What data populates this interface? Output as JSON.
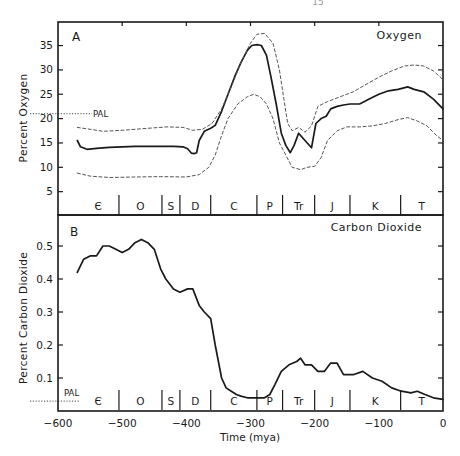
{
  "page": {
    "number_fragment": "15"
  },
  "chart_data": [
    {
      "panel": "A",
      "type": "line",
      "title": "Oxygen",
      "xlabel": "Time (mya)",
      "ylabel": "Percent Oxygen",
      "xlim": [
        -600,
        0
      ],
      "ylim": [
        0,
        39
      ],
      "yticks": [
        5,
        10,
        15,
        20,
        25,
        30,
        35
      ],
      "reference_line": {
        "label": "PAL",
        "value": 21
      },
      "series": [
        {
          "name": "Oxygen (best estimate)",
          "style": "solid",
          "x": [
            -570,
            -565,
            -555,
            -540,
            -520,
            -500,
            -480,
            -460,
            -440,
            -420,
            -405,
            -398,
            -392,
            -388,
            -384,
            -380,
            -372,
            -362,
            -355,
            -345,
            -335,
            -325,
            -315,
            -305,
            -298,
            -290,
            -283,
            -275,
            -268,
            -260,
            -252,
            -245,
            -238,
            -232,
            -225,
            -215,
            -205,
            -198,
            -190,
            -182,
            -175,
            -165,
            -155,
            -145,
            -130,
            -115,
            -100,
            -85,
            -70,
            -55,
            -45,
            -30,
            -15,
            0
          ],
          "values": [
            15.5,
            14.2,
            13.7,
            13.9,
            14.1,
            14.2,
            14.3,
            14.3,
            14.3,
            14.3,
            14.2,
            13.8,
            12.9,
            12.8,
            13.0,
            15.5,
            17.4,
            18.0,
            18.6,
            21.5,
            25.0,
            28.5,
            31.5,
            34.0,
            35.0,
            35.2,
            35.0,
            33.0,
            28.5,
            23.0,
            17.0,
            14.5,
            13.0,
            14.5,
            17.0,
            15.5,
            14.0,
            19.0,
            20.0,
            20.5,
            22.0,
            22.5,
            22.8,
            23.0,
            23.0,
            24.0,
            25.0,
            25.7,
            26.0,
            26.5,
            26.0,
            25.5,
            24.0,
            22.0
          ]
        },
        {
          "name": "Oxygen upper bound",
          "style": "dashed",
          "x": [
            -570,
            -550,
            -530,
            -500,
            -460,
            -430,
            -405,
            -390,
            -375,
            -360,
            -345,
            -330,
            -315,
            -300,
            -290,
            -278,
            -265,
            -255,
            -248,
            -242,
            -235,
            -225,
            -215,
            -205,
            -195,
            -180,
            -160,
            -140,
            -120,
            -100,
            -80,
            -60,
            -45,
            -30,
            -15,
            0
          ],
          "values": [
            18.2,
            17.8,
            17.4,
            17.6,
            18.0,
            18.3,
            18.2,
            17.6,
            17.8,
            19.0,
            22.0,
            26.5,
            31.5,
            35.5,
            37.3,
            37.5,
            35.5,
            30.0,
            24.0,
            19.0,
            17.5,
            18.2,
            17.2,
            18.5,
            22.5,
            23.5,
            24.5,
            25.5,
            27.0,
            28.5,
            29.8,
            30.8,
            31.0,
            30.8,
            29.8,
            28.0
          ]
        },
        {
          "name": "Oxygen lower bound",
          "style": "dashed",
          "x": [
            -570,
            -550,
            -520,
            -480,
            -440,
            -400,
            -380,
            -365,
            -355,
            -345,
            -335,
            -320,
            -305,
            -295,
            -285,
            -275,
            -265,
            -255,
            -245,
            -235,
            -222,
            -212,
            -200,
            -190,
            -180,
            -165,
            -150,
            -130,
            -110,
            -90,
            -70,
            -55,
            -40,
            -25,
            -10,
            0
          ],
          "values": [
            8.8,
            8.2,
            7.9,
            8.0,
            8.1,
            8.0,
            8.5,
            10.0,
            12.5,
            16.5,
            20.0,
            23.0,
            24.5,
            25.0,
            24.5,
            23.0,
            20.0,
            15.0,
            12.5,
            10.0,
            9.5,
            10.0,
            10.2,
            12.0,
            15.5,
            17.5,
            18.3,
            18.3,
            18.5,
            19.0,
            19.8,
            20.2,
            19.5,
            18.5,
            16.5,
            15.5
          ]
        }
      ]
    },
    {
      "panel": "B",
      "type": "line",
      "title": "Carbon Dioxide",
      "xlabel": "Time (mya)",
      "ylabel": "Percent Carbon Dioxide",
      "xlim": [
        -600,
        0
      ],
      "ylim": [
        0,
        0.59
      ],
      "yticks": [
        0.1,
        0.2,
        0.3,
        0.4,
        0.5
      ],
      "xticks": [
        -600,
        -500,
        -400,
        -300,
        -200,
        -100,
        0
      ],
      "reference_line": {
        "label": "PAL",
        "value": 0.03
      },
      "series": [
        {
          "name": "Carbon Dioxide",
          "style": "solid",
          "x": [
            -570,
            -560,
            -550,
            -540,
            -530,
            -520,
            -510,
            -500,
            -490,
            -480,
            -470,
            -460,
            -450,
            -440,
            -432,
            -420,
            -410,
            -398,
            -390,
            -380,
            -372,
            -362,
            -355,
            -345,
            -338,
            -330,
            -322,
            -315,
            -305,
            -295,
            -285,
            -278,
            -270,
            -262,
            -252,
            -240,
            -228,
            -222,
            -215,
            -205,
            -195,
            -185,
            -175,
            -165,
            -155,
            -140,
            -125,
            -110,
            -95,
            -80,
            -65,
            -50,
            -40,
            -28,
            -15,
            0
          ],
          "values": [
            0.42,
            0.46,
            0.47,
            0.47,
            0.5,
            0.5,
            0.49,
            0.48,
            0.49,
            0.51,
            0.52,
            0.51,
            0.49,
            0.43,
            0.4,
            0.37,
            0.36,
            0.37,
            0.37,
            0.32,
            0.3,
            0.28,
            0.2,
            0.1,
            0.07,
            0.06,
            0.05,
            0.045,
            0.04,
            0.04,
            0.04,
            0.04,
            0.05,
            0.08,
            0.12,
            0.14,
            0.15,
            0.16,
            0.14,
            0.14,
            0.12,
            0.12,
            0.145,
            0.145,
            0.11,
            0.11,
            0.12,
            0.1,
            0.09,
            0.07,
            0.06,
            0.055,
            0.06,
            0.05,
            0.04,
            0.035
          ]
        }
      ]
    }
  ],
  "periods": [
    {
      "label": "Є",
      "start": -570,
      "end": -505
    },
    {
      "label": "O",
      "start": -505,
      "end": -438
    },
    {
      "label": "S",
      "start": -438,
      "end": -410
    },
    {
      "label": "D",
      "start": -410,
      "end": -362
    },
    {
      "label": "C",
      "start": -362,
      "end": -290
    },
    {
      "label": "P",
      "start": -290,
      "end": -250
    },
    {
      "label": "Tr",
      "start": -250,
      "end": -200
    },
    {
      "label": "J",
      "start": -200,
      "end": -145
    },
    {
      "label": "K",
      "start": -145,
      "end": -66
    },
    {
      "label": "T",
      "start": -66,
      "end": 0
    }
  ],
  "labels": {
    "panel_a": "A",
    "panel_b": "B",
    "title_a": "Oxygen",
    "title_b": "Carbon Dioxide",
    "ylabel_a": "Percent Oxygen",
    "ylabel_b": "Percent Carbon Dioxide",
    "xlabel": "Time (mya)",
    "pal": "PAL"
  },
  "colors": {
    "ink": "#1a1a1a",
    "dashed": "#555555",
    "background": "#ffffff"
  }
}
